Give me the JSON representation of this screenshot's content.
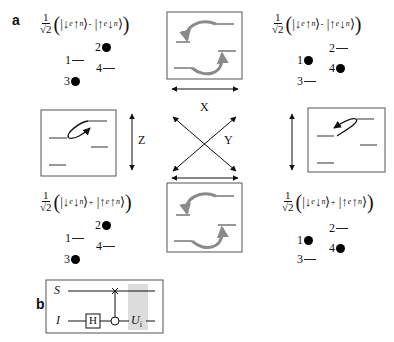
{
  "panels": {
    "a": {
      "label": "a"
    },
    "b": {
      "label": "b"
    }
  },
  "states": {
    "top_left": {
      "coef_num": "1",
      "coef_den": "√2",
      "ket1": {
        "e": "↓",
        "n": "↑"
      },
      "op": "-",
      "ket2": {
        "e": "↑",
        "n": "↓"
      },
      "levels": [
        {
          "id": "2",
          "populated": true
        },
        {
          "id": "1",
          "populated": false
        },
        {
          "id": "4",
          "populated": false
        },
        {
          "id": "3",
          "populated": true
        }
      ]
    },
    "top_right": {
      "coef_num": "1",
      "coef_den": "√2",
      "ket1": {
        "e": "↓",
        "n": "↑"
      },
      "op": "-",
      "ket2": {
        "e": "↑",
        "n": "↓"
      },
      "levels": [
        {
          "id": "2",
          "populated": false
        },
        {
          "id": "1",
          "populated": true
        },
        {
          "id": "4",
          "populated": true
        },
        {
          "id": "3",
          "populated": false
        }
      ]
    },
    "bottom_left": {
      "coef_num": "1",
      "coef_den": "√2",
      "ket1": {
        "e": "↓",
        "n": "↓"
      },
      "op": "+",
      "ket2": {
        "e": "↑",
        "n": "↑"
      },
      "levels": [
        {
          "id": "2",
          "populated": true
        },
        {
          "id": "1",
          "populated": false
        },
        {
          "id": "4",
          "populated": false
        },
        {
          "id": "3",
          "populated": true
        }
      ]
    },
    "bottom_right": {
      "coef_num": "1",
      "coef_den": "√2",
      "ket1": {
        "e": "↓",
        "n": "↓"
      },
      "op": "+",
      "ket2": {
        "e": "↑",
        "n": "↑"
      },
      "levels": [
        {
          "id": "2",
          "populated": false
        },
        {
          "id": "1",
          "populated": true
        },
        {
          "id": "4",
          "populated": true
        },
        {
          "id": "3",
          "populated": false
        }
      ]
    }
  },
  "subscripts": {
    "electron": "e",
    "nucleus": "n"
  },
  "transitions": {
    "x_label": "X",
    "y_label": "Y",
    "z_label": "Z"
  },
  "circuit": {
    "wire_top": "S",
    "wire_bottom": "I",
    "gate_h": "H",
    "gate_u": "U",
    "gate_u_sub": "i"
  },
  "colors": {
    "ink": "#111111",
    "box_border": "#555555",
    "arrow_gray": "#9a9a9a",
    "highlight_gray": "#dcdcdc"
  }
}
